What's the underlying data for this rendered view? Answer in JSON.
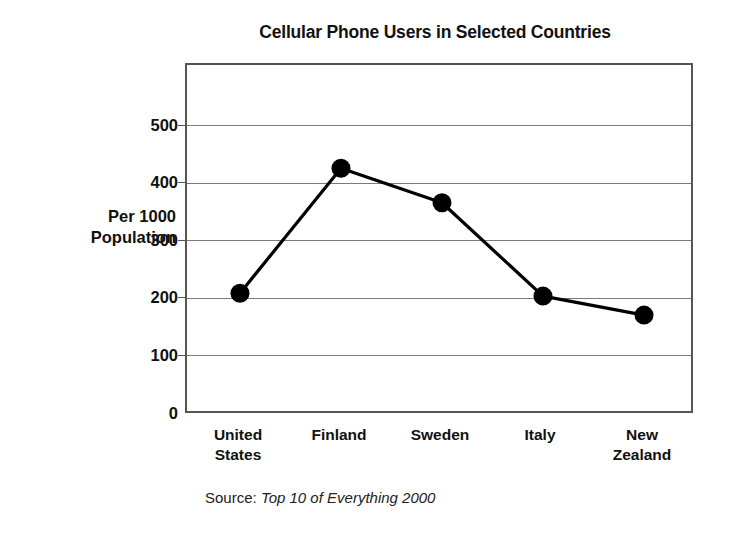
{
  "chart_data": {
    "type": "line",
    "title": "Cellular Phone Users in Selected Countries",
    "xlabel": "",
    "ylabel": "Per 1000 Population",
    "ylabel_lines": [
      "Per 1000",
      "Population"
    ],
    "categories": [
      "United States",
      "Finland",
      "Sweden",
      "Italy",
      "New Zealand"
    ],
    "category_lines": [
      [
        "United",
        "States"
      ],
      [
        "Finland"
      ],
      [
        "Sweden"
      ],
      [
        "Italy"
      ],
      [
        "New",
        "Zealand"
      ]
    ],
    "values": [
      208,
      425,
      365,
      203,
      170
    ],
    "ylim": [
      0,
      550
    ],
    "yticks": [
      0,
      100,
      200,
      300,
      400,
      500
    ],
    "ytick_labels": [
      "0",
      "100",
      "200",
      "300",
      "400",
      "500"
    ],
    "grid": true,
    "grid_axis": "y",
    "legend": null,
    "marker": "filled-circle",
    "series_color": "#000000",
    "grid_color": "#7a7a7a",
    "frame_color": "#555555"
  },
  "source": {
    "label": "Source: ",
    "title": "Top 10 of Everything 2000"
  }
}
